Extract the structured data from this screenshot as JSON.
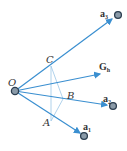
{
  "diagram": {
    "type": "vector-geometry",
    "colors": {
      "vector": "#3a8fd0",
      "construction": "#9cc6e6",
      "node_fill": "#8a9aa8",
      "node_stroke": "#2c3e50",
      "text": "#333333"
    },
    "points": {
      "O": {
        "label": "O",
        "x": 15,
        "y": 91
      },
      "C": {
        "label": "C",
        "x": 51,
        "y": 66
      },
      "B": {
        "label": "B",
        "x": 63,
        "y": 99
      },
      "A": {
        "label": "A",
        "x": 51,
        "y": 121
      }
    },
    "vectors": [
      {
        "name": "a3",
        "label_main": "a",
        "label_sub": "3",
        "to": {
          "x": 118,
          "y": 15
        }
      },
      {
        "name": "Gh",
        "label_main": "G",
        "label_sub": "h",
        "to": {
          "x": 100,
          "y": 73
        }
      },
      {
        "name": "a2",
        "label_main": "a",
        "label_sub": "2",
        "to": {
          "x": 113,
          "y": 106
        }
      },
      {
        "name": "a1",
        "label_main": "a",
        "label_sub": "1",
        "to": {
          "x": 84,
          "y": 136
        }
      }
    ]
  }
}
